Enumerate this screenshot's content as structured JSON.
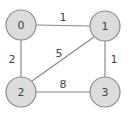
{
  "graph": {
    "type": "undirected-weighted",
    "nodes": [
      {
        "id": "0",
        "label": "0",
        "x": 21,
        "y": 25
      },
      {
        "id": "1",
        "label": "1",
        "x": 105,
        "y": 26
      },
      {
        "id": "2",
        "label": "2",
        "x": 21,
        "y": 92
      },
      {
        "id": "3",
        "label": "3",
        "x": 105,
        "y": 92
      }
    ],
    "edges": [
      {
        "from": "0",
        "to": "1",
        "weight": "1"
      },
      {
        "from": "0",
        "to": "2",
        "weight": "2"
      },
      {
        "from": "1",
        "to": "2",
        "weight": "5"
      },
      {
        "from": "1",
        "to": "3",
        "weight": "1"
      },
      {
        "from": "2",
        "to": "3",
        "weight": "8"
      }
    ]
  },
  "colors": {
    "node_fill": "#dcdcdc",
    "node_stroke": "#8c8c8c",
    "edge": "#8a8a8a",
    "text": "#444444"
  }
}
